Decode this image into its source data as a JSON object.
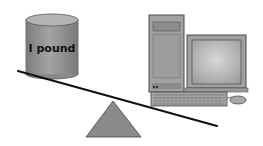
{
  "diagram": {
    "left_object": {
      "type": "cylinder-weight",
      "label": "I pound",
      "color": "#8f8f8f"
    },
    "right_object": {
      "type": "desktop-computer",
      "parts": [
        "tower",
        "monitor",
        "keyboard",
        "mouse"
      ],
      "color": "#9a9a9a"
    },
    "beam": {
      "color": "#111111",
      "tilt": "down-right"
    },
    "fulcrum": {
      "shape": "triangle",
      "color": "#8a8a8a"
    }
  }
}
